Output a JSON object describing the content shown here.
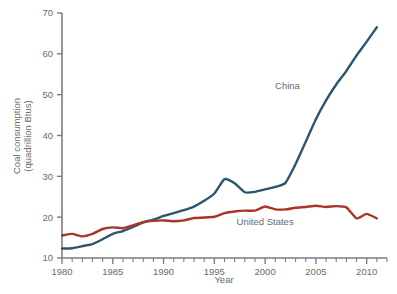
{
  "chart_data": {
    "type": "line",
    "title": "",
    "xlabel": "Year",
    "ylabel": "Coal consumption (quadrillion Btus)",
    "ylabel_line1": "Coal consumption",
    "ylabel_line2": "(quadrillion Btus)",
    "xlim": [
      1980,
      2012
    ],
    "ylim": [
      10,
      70
    ],
    "ytick_values": [
      10,
      20,
      30,
      40,
      50,
      60,
      70
    ],
    "ytick_labels": [
      "10",
      "20",
      "30",
      "40",
      "50",
      "60",
      "70"
    ],
    "xtick_values": [
      1980,
      1985,
      1990,
      1995,
      2000,
      2005,
      2010
    ],
    "xtick_labels": [
      "1980",
      "1985",
      "1990",
      "1995",
      "2000",
      "2005",
      "2010"
    ],
    "xminor_step": 1,
    "grid": false,
    "legend_position": "inline-annotation",
    "x": [
      1980,
      1981,
      1982,
      1983,
      1984,
      1985,
      1986,
      1987,
      1988,
      1989,
      1990,
      1991,
      1992,
      1993,
      1994,
      1995,
      1996,
      1997,
      1998,
      1999,
      2000,
      2001,
      2002,
      2003,
      2004,
      2005,
      2006,
      2007,
      2008,
      2009,
      2010,
      2011
    ],
    "series": [
      {
        "name": "China",
        "color": "#2d556e",
        "label_x": 2002.2,
        "label_y": 51.5,
        "values": [
          12.3,
          12.4,
          12.9,
          13.4,
          14.6,
          15.9,
          16.6,
          17.6,
          18.7,
          19.4,
          20.3,
          21.0,
          21.7,
          22.6,
          24.0,
          25.8,
          29.3,
          28.3,
          26.1,
          26.2,
          26.8,
          27.4,
          28.4,
          33.0,
          38.5,
          44.0,
          48.6,
          52.5,
          55.8,
          59.6,
          63.0,
          66.5
        ]
      },
      {
        "name": "United States",
        "color": "#a8352a",
        "label_x": 2000.0,
        "label_y": 18.2,
        "values": [
          15.5,
          15.9,
          15.3,
          15.9,
          17.1,
          17.5,
          17.3,
          18.0,
          18.8,
          19.1,
          19.2,
          19.0,
          19.2,
          19.8,
          19.9,
          20.1,
          21.0,
          21.4,
          21.6,
          21.6,
          22.6,
          21.9,
          21.9,
          22.3,
          22.5,
          22.8,
          22.5,
          22.7,
          22.4,
          19.7,
          20.8,
          19.7
        ]
      }
    ]
  },
  "axes": {
    "axis_color": "#7d7d7d",
    "tick_color": "#7d7d7d",
    "text_color": "#6b6b6b"
  }
}
